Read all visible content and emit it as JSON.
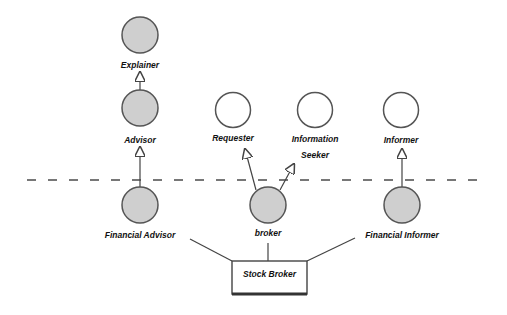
{
  "diagram": {
    "colors": {
      "background": "#ffffff",
      "stroke": "#555555",
      "filled_node": "#cfcfcf",
      "empty_node": "#ffffff",
      "line": "#444444",
      "label": "#111111"
    },
    "separator": {
      "style": "dashed",
      "y": 180,
      "x1": 27,
      "x2": 482
    },
    "nodes": [
      {
        "id": "explainer",
        "label": "Explainer",
        "filled": true,
        "cx": 140,
        "cy": 35
      },
      {
        "id": "advisor",
        "label": "Advisor",
        "filled": true,
        "cx": 140,
        "cy": 108
      },
      {
        "id": "requester",
        "label": "Requester",
        "filled": false,
        "cx": 233,
        "cy": 110
      },
      {
        "id": "information-seeker",
        "label_line1": "Information",
        "label_line2": "Seeker",
        "filled": false,
        "cx": 315,
        "cy": 110
      },
      {
        "id": "informer",
        "label": "Informer",
        "filled": false,
        "cx": 401,
        "cy": 110
      },
      {
        "id": "financial-advisor",
        "label": "Financial Advisor",
        "filled": true,
        "cx": 140,
        "cy": 205
      },
      {
        "id": "broker",
        "label": "broker",
        "filled": true,
        "cx": 268,
        "cy": 205
      },
      {
        "id": "financial-informer",
        "label": "Financial Informer",
        "filled": true,
        "cx": 402,
        "cy": 205
      }
    ],
    "box": {
      "label": "Stock Broker",
      "x": 232,
      "y": 261,
      "w": 75,
      "h": 33
    },
    "edges": [
      {
        "from": "advisor",
        "to": "explainer",
        "type": "generalization"
      },
      {
        "from": "financial-advisor",
        "to": "advisor",
        "type": "generalization"
      },
      {
        "from": "broker",
        "to": "requester",
        "type": "generalization"
      },
      {
        "from": "broker",
        "to": "information-seeker",
        "type": "generalization"
      },
      {
        "from": "financial-informer",
        "to": "informer",
        "type": "generalization"
      },
      {
        "from": "stock-broker",
        "to": "financial-advisor",
        "type": "association"
      },
      {
        "from": "stock-broker",
        "to": "broker",
        "type": "association"
      },
      {
        "from": "stock-broker",
        "to": "financial-informer",
        "type": "association"
      }
    ]
  }
}
